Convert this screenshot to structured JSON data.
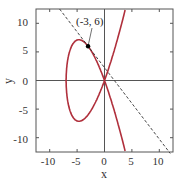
{
  "chart_data": {
    "type": "line",
    "title": "",
    "xlabel": "x",
    "ylabel": "y",
    "xlim": [
      -12.5,
      12.5
    ],
    "ylim": [
      -12.5,
      12.5
    ],
    "xticks": [
      -10,
      -5,
      0,
      5,
      10
    ],
    "yticks": [
      -10,
      -5,
      0,
      5,
      10
    ],
    "grid": false,
    "series": [
      {
        "name": "curve y^2 = x^3 + 7x^2",
        "style": "solid",
        "color": "#b0303c"
      },
      {
        "name": "tangent line y = -1.25x + 2.25",
        "style": "dashed",
        "color": "#333333"
      }
    ],
    "annotations": [
      {
        "text": "(-3, 6)",
        "x": -3,
        "y": 6
      }
    ]
  },
  "labels": {
    "x_axis": "x",
    "y_axis": "y",
    "point": "(-3, 6)",
    "xt": [
      "-10",
      "-5",
      "0",
      "5",
      "10"
    ],
    "yt": [
      "10",
      "5",
      "0",
      "-5",
      "-10"
    ]
  }
}
